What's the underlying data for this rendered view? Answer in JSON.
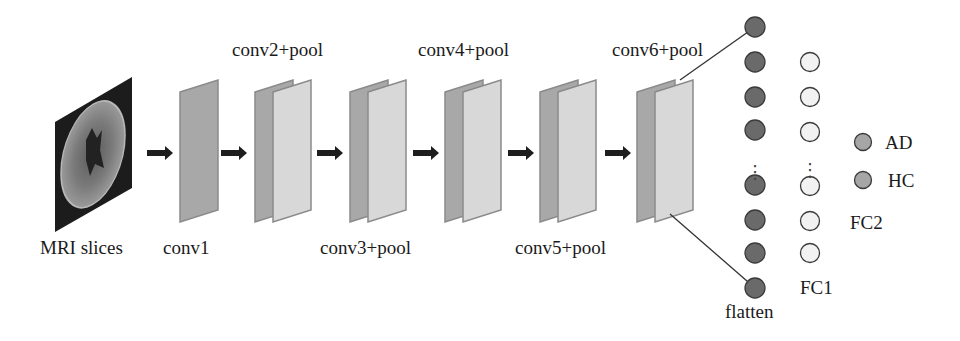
{
  "diagram": {
    "type": "cnn-architecture",
    "input": {
      "label": "MRI slices",
      "icon": "brain-mri-slice"
    },
    "layers": [
      {
        "id": "conv1",
        "label": "conv1",
        "plates": 1
      },
      {
        "id": "conv2",
        "label": "conv2+pool",
        "plates": 2
      },
      {
        "id": "conv3",
        "label": "conv3+pool",
        "plates": 2
      },
      {
        "id": "conv4",
        "label": "conv4+pool",
        "plates": 2
      },
      {
        "id": "conv5",
        "label": "conv5+pool",
        "plates": 2
      },
      {
        "id": "conv6",
        "label": "conv6+pool",
        "plates": 2
      }
    ],
    "flatten": {
      "label": "flatten",
      "visible_nodes_top": 4,
      "visible_nodes_bottom": 4,
      "ellipsis": "⋮"
    },
    "fc1": {
      "label": "FC1",
      "visible_nodes_top": 3,
      "visible_nodes_bottom": 3,
      "ellipsis": "⋮"
    },
    "fc2": {
      "label": "FC2",
      "outputs": [
        {
          "label": "AD"
        },
        {
          "label": "HC"
        }
      ]
    },
    "colors": {
      "mri_bg": "#1c1c1c",
      "plate_dark": "#a8a8a8",
      "plate_light": "#d8d8d8",
      "plate_edge": "#8a8a8a",
      "arrow": "#1e1e1e",
      "flatten_node": "#6a6a6a",
      "fc1_node": "#f2f2f2",
      "output_node": "#a6a6a6",
      "node_stroke": "#3a3a3a"
    }
  }
}
